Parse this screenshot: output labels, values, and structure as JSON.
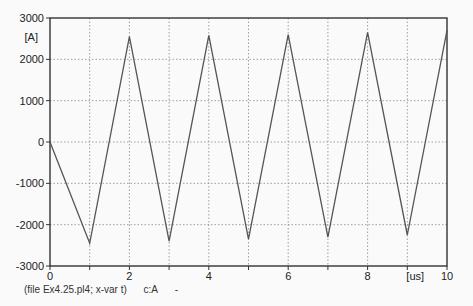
{
  "chart_data": {
    "type": "line",
    "title": "",
    "xlabel": "[us]",
    "ylabel": "[A]",
    "xlim": [
      0,
      10
    ],
    "ylim": [
      -3000,
      3000
    ],
    "grid": true,
    "x_ticks": [
      "0",
      "2",
      "4",
      "6",
      "8",
      "10"
    ],
    "y_ticks": [
      "3000",
      "2000",
      "1000",
      "0",
      "-1000",
      "-2000",
      "-3000"
    ],
    "series": [
      {
        "name": "c:A",
        "color": "#555555",
        "x": [
          0,
          1,
          2,
          3,
          4,
          5,
          6,
          7,
          8,
          9,
          10
        ],
        "y": [
          0,
          -2450,
          2550,
          -2400,
          2580,
          -2350,
          2600,
          -2300,
          2650,
          -2250,
          2700
        ]
      }
    ]
  },
  "footer": {
    "file_label": "(file Ex4.25.pl4; x-var t)",
    "series_label": "c:A",
    "marker": "-"
  }
}
